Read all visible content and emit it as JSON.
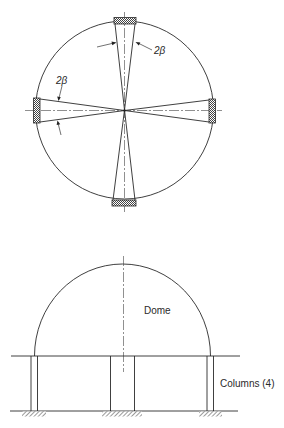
{
  "plan_view": {
    "angle_label_top": "2β",
    "angle_label_left": "2β",
    "pads": [
      "top",
      "right",
      "bottom",
      "left"
    ]
  },
  "elevation_view": {
    "dome_label": "Dome",
    "columns_label": "Columns (4)"
  },
  "colors": {
    "line": "#2a2a2a",
    "hatch": "#555555",
    "background": "#ffffff"
  }
}
